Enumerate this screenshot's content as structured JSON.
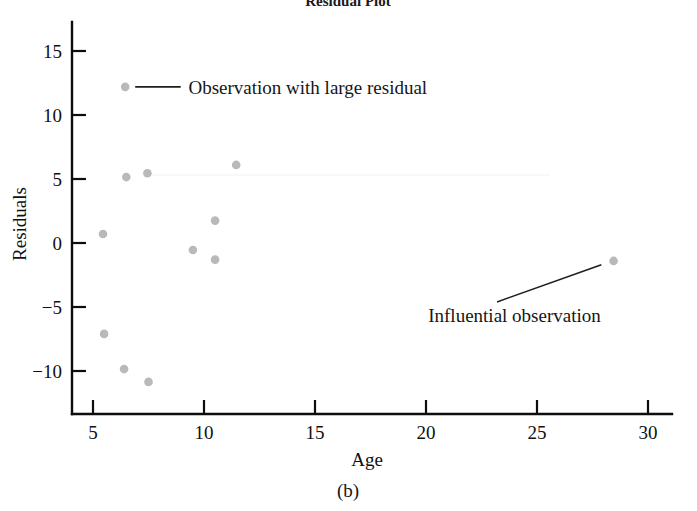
{
  "figure": {
    "title": "Residual Plot",
    "panel_caption": "(b)",
    "point_color": "#b9b9b9",
    "axis_color": "#0d0d0d",
    "annotation_color": "#1e1e1e"
  },
  "chart_data": {
    "type": "scatter",
    "title": "Residual Plot",
    "xlabel": "Age",
    "ylabel": "Residuals",
    "xlim": [
      3.6,
      31.1
    ],
    "ylim": [
      -12.0,
      16.0
    ],
    "grid": false,
    "legend": null,
    "xticks": [
      5,
      10,
      15,
      20,
      25,
      30
    ],
    "xtick_labels": [
      "5",
      "10",
      "15",
      "20",
      "25",
      "30"
    ],
    "yticks": [
      15,
      10,
      5,
      0,
      -5,
      -10
    ],
    "ytick_labels": [
      "15",
      "10",
      "5",
      "0",
      "−5",
      "−10"
    ],
    "points": [
      {
        "x": 5.45,
        "y": 0.7
      },
      {
        "x": 5.5,
        "y": -7.1
      },
      {
        "x": 6.5,
        "y": 5.15
      },
      {
        "x": 6.4,
        "y": -9.85
      },
      {
        "x": 7.45,
        "y": 5.45
      },
      {
        "x": 7.5,
        "y": -10.85
      },
      {
        "x": 9.5,
        "y": -0.55
      },
      {
        "x": 10.5,
        "y": 1.75
      },
      {
        "x": 10.5,
        "y": -1.3
      },
      {
        "x": 11.45,
        "y": 6.1
      },
      {
        "x": 28.45,
        "y": -1.4
      }
    ],
    "annotations": [
      {
        "name": "large-residual",
        "text": "Observation with large residual",
        "point": {
          "x": 6.45,
          "y": 12.2
        },
        "text_x": 9.3,
        "text_y": 12.2,
        "leader_from": {
          "x": 6.9,
          "y": 12.2
        },
        "leader_to": {
          "x": 8.95,
          "y": 12.2
        }
      },
      {
        "name": "influential-observation",
        "text": "Influential observation",
        "point": {
          "x": 28.45,
          "y": -1.4
        },
        "text_x": 20.1,
        "text_y": -5.6,
        "leader_from": {
          "x": 23.2,
          "y": -4.6
        },
        "leader_to": {
          "x": 27.9,
          "y": -1.7
        }
      }
    ]
  }
}
